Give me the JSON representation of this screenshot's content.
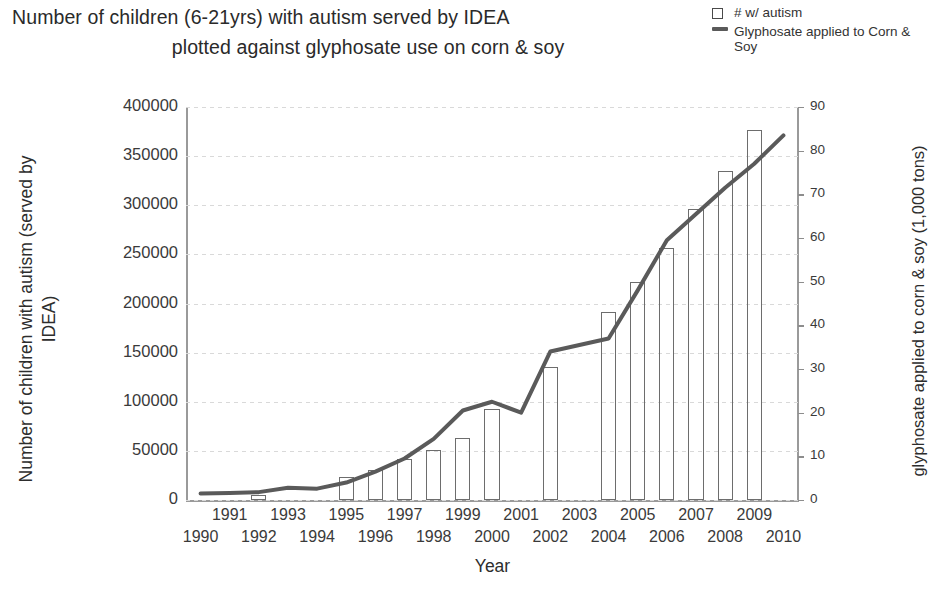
{
  "title": {
    "line1": "Number of children (6-21yrs) with autism served by IDEA",
    "line2": "plotted against glyphosate use on corn & soy"
  },
  "legend": {
    "items": [
      {
        "key": "square-outline",
        "label": "# w/ autism"
      },
      {
        "key": "line",
        "label": "Glyphosate applied to Corn & Soy"
      }
    ]
  },
  "axes": {
    "x_title": "Year",
    "y_left_title": "Number of children with autism (served by IDEA)",
    "y_right_title": "glyphosate applied to corn & soy (1,000 tons)",
    "y_left_ticks": [
      "0",
      "50000",
      "100000",
      "150000",
      "200000",
      "250000",
      "300000",
      "350000",
      "400000"
    ],
    "y_right_ticks": [
      "0",
      "10",
      "20",
      "30",
      "40",
      "50",
      "60",
      "70",
      "80",
      "90"
    ],
    "x_ticks_top": [
      "1991",
      "1993",
      "1995",
      "1997",
      "1999",
      "2001",
      "2003",
      "2005",
      "2007",
      "2009"
    ],
    "x_ticks_bottom": [
      "1990",
      "1992",
      "1994",
      "1996",
      "1998",
      "2000",
      "2002",
      "2004",
      "2006",
      "2008",
      "2010"
    ]
  },
  "colors": {
    "bar_stroke": "#6d6d6d",
    "line_stroke": "#5a5a5a",
    "grid": "#d9d9d9",
    "axis": "#9a9a9a",
    "text": "#2d2d2d"
  },
  "chart_data": {
    "type": "bar",
    "title": "Number of children (6-21yrs) with autism served by IDEA plotted against glyphosate use on corn & soy",
    "xlabel": "Year",
    "ylabel": "Number of children with autism (served by IDEA)",
    "y2label": "glyphosate applied to corn & soy (1,000 tons)",
    "grid": true,
    "legend_position": "top-right",
    "categories": [
      1990,
      1991,
      1992,
      1993,
      1994,
      1995,
      1996,
      1997,
      1998,
      1999,
      2000,
      2001,
      2002,
      2003,
      2004,
      2005,
      2006,
      2007,
      2008,
      2009,
      2010
    ],
    "ylim": [
      0,
      400000
    ],
    "y2lim": [
      0,
      90
    ],
    "series": [
      {
        "name": "# w/ autism",
        "type": "bar",
        "axis": "left",
        "values": [
          0,
          0,
          5000,
          0,
          0,
          23000,
          31000,
          42000,
          51000,
          63000,
          93000,
          0,
          135000,
          0,
          191000,
          222000,
          256000,
          296000,
          335000,
          377000,
          0
        ]
      },
      {
        "name": "Glyphosate applied to Corn & Soy",
        "type": "line",
        "axis": "right",
        "values": [
          1.5,
          1.6,
          1.8,
          2.8,
          2.6,
          4.0,
          6.5,
          9.5,
          14.0,
          20.5,
          22.5,
          20.0,
          34.0,
          35.5,
          37.0,
          48.0,
          59.5,
          65.5,
          71.5,
          77.0,
          83.5
        ]
      }
    ]
  }
}
